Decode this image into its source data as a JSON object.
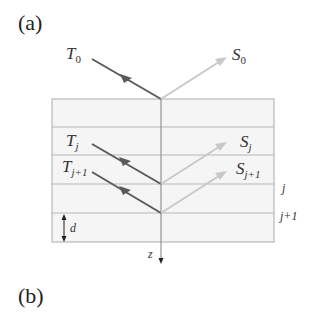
{
  "panels": {
    "a": "(a)",
    "b": "(b)"
  },
  "labels": {
    "T0": "T",
    "T0_sub": "0",
    "S0": "S",
    "S0_sub": "0",
    "Tj": "T",
    "Tj_sub": "j",
    "Tj1": "T",
    "Tj1_sub": "j+1",
    "Sj": "S",
    "Sj_sub": "j",
    "Sj1": "S",
    "Sj1_sub": "j+1",
    "layer_j": "j",
    "layer_j1": "j+1",
    "thickness": "d",
    "axis": "z"
  },
  "colors": {
    "incident": "#5a5a5a",
    "reflected": "#c4c4c4",
    "layer_fill": "#f4f4f4",
    "layer_line": "#b5b5b5",
    "axis": "#888888"
  }
}
